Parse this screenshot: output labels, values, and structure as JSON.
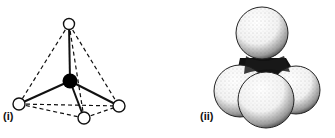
{
  "figure": {
    "panels": [
      {
        "label": "(i)",
        "type": "ball-and-stick tetrahedral molecule",
        "central_atom": {
          "fill": "#000000"
        },
        "outer_atoms": 4,
        "outer_atom_fill": "#ffffff"
      },
      {
        "label": "(ii)",
        "type": "space-filling tetrahedral molecule",
        "spheres": 4
      }
    ]
  }
}
